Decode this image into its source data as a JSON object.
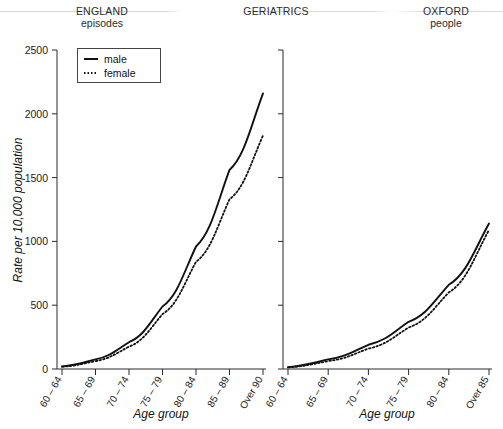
{
  "header": {
    "left": {
      "line1": "ENGLAND",
      "line2": "episodes"
    },
    "center": {
      "line1": "GERIATRICS",
      "line2": ""
    },
    "right": {
      "line1": "OXFORD",
      "line2": "people"
    }
  },
  "legend": {
    "male_label": "male",
    "female_label": "female"
  },
  "axes": {
    "ylabel": "Rate per 10,000 population",
    "xlabel_left": "Age group",
    "xlabel_right": "Age group",
    "yticks": [
      "0",
      "500",
      "1000",
      "1500",
      "2000",
      "2500"
    ]
  },
  "colors": {
    "line": "#111111",
    "axis": "#2a2a2a",
    "text": "#1a1a1a",
    "background": "#ffffff"
  },
  "chart_data": [
    {
      "type": "line",
      "title": "ENGLAND episodes",
      "panel": "left",
      "xlabel": "Age group",
      "ylabel": "Rate per 10,000 population",
      "ylim": [
        0,
        2500
      ],
      "yticks": [
        0,
        500,
        1000,
        1500,
        2000,
        2500
      ],
      "grid": false,
      "legend_position": "top-left",
      "categories": [
        "60 – 64",
        "65 – 69",
        "70 – 74",
        "75 – 79",
        "80 – 84",
        "85 – 89",
        "Over 90"
      ],
      "series": [
        {
          "name": "male",
          "style": "solid",
          "values": [
            20,
            75,
            210,
            490,
            960,
            1560,
            2160
          ]
        },
        {
          "name": "female",
          "style": "dotted",
          "values": [
            18,
            62,
            175,
            430,
            840,
            1330,
            1830
          ]
        }
      ]
    },
    {
      "type": "line",
      "title": "OXFORD people",
      "panel": "right",
      "xlabel": "Age group",
      "ylabel": "Rate per 10,000 population",
      "ylim": [
        0,
        2500
      ],
      "yticks": [
        0,
        500,
        1000,
        1500,
        2000,
        2500
      ],
      "grid": false,
      "legend_position": "none",
      "categories": [
        "60 – 64",
        "65 – 69",
        "70 – 74",
        "75 – 79",
        "80 – 84",
        "Over 85"
      ],
      "series": [
        {
          "name": "male",
          "style": "solid",
          "values": [
            15,
            75,
            190,
            370,
            660,
            1140
          ]
        },
        {
          "name": "female",
          "style": "dotted",
          "values": [
            13,
            62,
            160,
            325,
            600,
            1090
          ]
        }
      ]
    }
  ]
}
